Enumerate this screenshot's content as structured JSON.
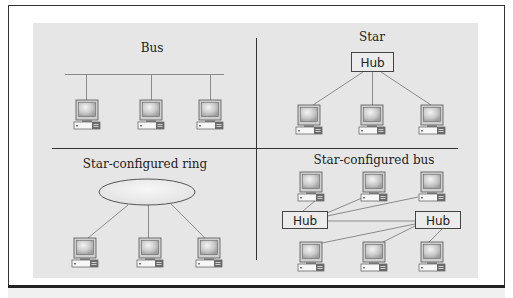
{
  "figure": {
    "panels": [
      {
        "id": "bus",
        "title": "Bus",
        "hub_labels": []
      },
      {
        "id": "star",
        "title": "Star",
        "hub_labels": [
          "Hub"
        ]
      },
      {
        "id": "star-ring",
        "title": "Star-configured ring",
        "hub_labels": []
      },
      {
        "id": "star-bus",
        "title": "Star-configured bus",
        "hub_labels": [
          "Hub",
          "Hub"
        ]
      }
    ]
  },
  "colors": {
    "panel_bg": "#e6e6e6",
    "frame": "#333333",
    "line": "#8a8a8a",
    "hub_fill": "#ececec",
    "ellipse_fill": "#ebebeb"
  }
}
